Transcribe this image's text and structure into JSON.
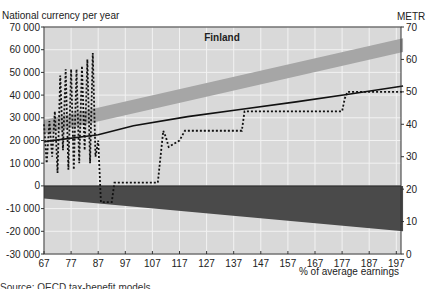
{
  "chart_data": {
    "type": "line",
    "title": "Finland",
    "ylabel_left": "National currency per year",
    "ylabel_right": "METR",
    "xlabel": "% of average earnings",
    "xlim": [
      67,
      200
    ],
    "ylim_left": [
      -30000,
      70000
    ],
    "ylim_right": [
      0,
      70
    ],
    "x_ticks": [
      67,
      77,
      87,
      97,
      107,
      117,
      127,
      137,
      147,
      157,
      167,
      177,
      187,
      197
    ],
    "y_ticks_left": [
      "70 000",
      "60 000",
      "50 000",
      "40 000",
      "30 000",
      "20 000",
      "10 000",
      "0",
      "-10 000",
      "-20 000",
      "-30 000"
    ],
    "y_ticks_right": [
      "70",
      "60",
      "50",
      "40",
      "30",
      "20",
      "10",
      "0"
    ],
    "grid": true,
    "series": [
      {
        "name": "Gross earnings band",
        "kind": "band",
        "color": "#a6a6a6",
        "x": [
          67,
          200
        ],
        "lower": [
          23000,
          59000
        ],
        "upper": [
          29000,
          65000
        ]
      },
      {
        "name": "Net income",
        "kind": "line",
        "color": "#111111",
        "x": [
          67,
          87,
          100,
          120,
          140,
          160,
          180,
          200
        ],
        "values": [
          19500,
          22500,
          26500,
          30500,
          33800,
          37000,
          40500,
          44000
        ]
      },
      {
        "name": "Taxes and contributions",
        "kind": "band",
        "color": "#4a4a4a",
        "x": [
          67,
          200
        ],
        "lower": [
          -5500,
          -20000
        ],
        "upper": [
          0,
          0
        ]
      },
      {
        "name": "METR",
        "kind": "dotted",
        "axis": "right",
        "color": "#111111",
        "x": [
          67,
          68,
          69,
          70,
          71,
          72,
          73,
          74,
          75,
          76,
          77,
          78,
          79,
          80,
          81,
          82,
          83,
          84,
          85,
          86,
          87,
          88,
          90,
          92,
          93,
          107,
          109,
          110,
          111,
          112,
          113,
          115,
          117,
          119,
          140,
          141,
          142,
          177,
          178,
          179,
          200
        ],
        "values": [
          40,
          28,
          41,
          30,
          44,
          25,
          55,
          32,
          57,
          26,
          57,
          26,
          57,
          28,
          58,
          32,
          60,
          28,
          62,
          30,
          35,
          16,
          16,
          16,
          22,
          22,
          22,
          30,
          38,
          36,
          33,
          34,
          35,
          38,
          38,
          44,
          44,
          44,
          48,
          50,
          50
        ]
      }
    ]
  },
  "footer_text": "Source: OECD tax-benefit models."
}
